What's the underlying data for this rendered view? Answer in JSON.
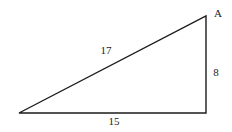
{
  "diagram": {
    "type": "right-triangle",
    "vertex_label": "A",
    "sides": {
      "hypotenuse": "17",
      "vertical": "8",
      "base": "15"
    },
    "line_color": "#1c1c1c",
    "background_color": "#ffffff"
  }
}
